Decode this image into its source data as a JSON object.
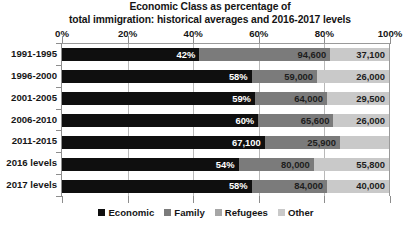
{
  "chart_data": {
    "type": "bar",
    "orientation": "horizontal",
    "stacked": true,
    "stacked_normalized": true,
    "title": "Economic Class as percentage of total immigration: historical averages and 2016-2017 levels",
    "title_lines": [
      "Economic Class as percentage of",
      "total immigration: historical averages and 2016-2017 levels"
    ],
    "xlabel": "",
    "ylabel": "",
    "xlim": [
      0,
      100
    ],
    "xticks": [
      0,
      20,
      40,
      60,
      80,
      100
    ],
    "xtick_labels": [
      "0%",
      "20%",
      "40%",
      "60%",
      "80%",
      "100%"
    ],
    "grid": true,
    "legend_position": "bottom",
    "categories": [
      "1991-1995",
      "1996-2000",
      "2001-2005",
      "2006-2010",
      "2011-2015",
      "2016 levels",
      "2017 levels"
    ],
    "series": [
      {
        "name": "Economic",
        "color": "#0f0f0f",
        "values": [
          42,
          58,
          59,
          60,
          62,
          54,
          58
        ],
        "labels": [
          "42%",
          "58%",
          "59%",
          "60%",
          "62%",
          "54%",
          "58%"
        ]
      },
      {
        "name": "Family",
        "color": "#7b7b7b",
        "values": [
          40,
          20,
          22,
          23,
          23,
          23,
          23
        ],
        "labels": [
          "94,600",
          "59,000",
          "64,000",
          "65,600",
          "67,100",
          "80,000",
          "84,000"
        ]
      },
      {
        "name": "Refugees",
        "color": "#a6a6a6",
        "values": [
          0,
          0,
          0,
          0,
          0,
          0,
          0
        ],
        "labels": [
          "",
          "",
          "",
          "",
          "",
          "",
          ""
        ]
      },
      {
        "name": "Other",
        "color": "#c9c9c9",
        "values": [
          18,
          22,
          19,
          17,
          15,
          23,
          19
        ],
        "labels": [
          "37,100",
          "26,000",
          "29,500",
          "26,000",
          "25,900",
          "55,800",
          "40,000"
        ]
      }
    ],
    "rows": [
      {
        "category": "1991-1995",
        "segments": [
          {
            "series": "Economic",
            "pct": 42,
            "label": "42%"
          },
          {
            "series": "Family",
            "pct": 40,
            "label": "94,600"
          },
          {
            "series": "Other",
            "pct": 18,
            "label": "37,100"
          }
        ]
      },
      {
        "category": "1996-2000",
        "segments": [
          {
            "series": "Economic",
            "pct": 58,
            "label": "58%"
          },
          {
            "series": "Family",
            "pct": 20,
            "label": "59,000"
          },
          {
            "series": "Other",
            "pct": 22,
            "label": "26,000"
          }
        ]
      },
      {
        "category": "2001-2005",
        "segments": [
          {
            "series": "Economic",
            "pct": 59,
            "label": "59%"
          },
          {
            "series": "Family",
            "pct": 22,
            "label": "64,000"
          },
          {
            "series": "Other",
            "pct": 19,
            "label": "29,500"
          }
        ]
      },
      {
        "category": "2006-2010",
        "segments": [
          {
            "series": "Economic",
            "pct": 60,
            "label": "60%"
          },
          {
            "series": "Family",
            "pct": 23,
            "label": "65,600"
          },
          {
            "series": "Other",
            "pct": 17,
            "label": "26,000"
          }
        ]
      },
      {
        "category": "2011-2015",
        "segments": [
          {
            "series": "Economic",
            "pct": 62,
            "label": "67,100"
          },
          {
            "series": "Family",
            "pct": 23,
            "label": "25,900"
          },
          {
            "series": "Other",
            "pct": 15,
            "label": ""
          }
        ]
      },
      {
        "category": "2016 levels",
        "segments": [
          {
            "series": "Economic",
            "pct": 54,
            "label": "54%"
          },
          {
            "series": "Family",
            "pct": 23,
            "label": "80,000"
          },
          {
            "series": "Other",
            "pct": 23,
            "label": "55,800"
          }
        ]
      },
      {
        "category": "2017 levels",
        "segments": [
          {
            "series": "Economic",
            "pct": 58,
            "label": "58%"
          },
          {
            "series": "Family",
            "pct": 23,
            "label": "84,000"
          },
          {
            "series": "Other",
            "pct": 19,
            "label": "40,000"
          }
        ]
      }
    ],
    "legend": [
      {
        "label": "Economic",
        "color": "#0f0f0f"
      },
      {
        "label": "Family",
        "color": "#7b7b7b"
      },
      {
        "label": "Refugees",
        "color": "#a6a6a6"
      },
      {
        "label": "Other",
        "color": "#c9c9c9"
      }
    ]
  }
}
